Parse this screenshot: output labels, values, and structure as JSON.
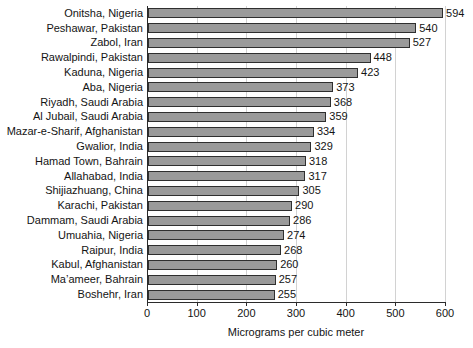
{
  "chart_data": {
    "type": "bar",
    "orientation": "horizontal",
    "title": "",
    "xlabel": "Micrograms per cubic meter",
    "ylabel": "",
    "xlim": [
      0,
      600
    ],
    "xticks": [
      0,
      100,
      200,
      300,
      400,
      500,
      600
    ],
    "grid": "vertical",
    "legend": "none",
    "bar_color": "#9a9a9a",
    "bar_edge_color": "#2f2f2f",
    "categories": [
      "Onitsha, Nigeria",
      "Peshawar, Pakistan",
      "Zabol, Iran",
      "Rawalpindi, Pakistan",
      "Kaduna, Nigeria",
      "Aba, Nigeria",
      "Riyadh, Saudi Arabia",
      "Al Jubail, Saudi Arabia",
      "Mazar-e-Sharif, Afghanistan",
      "Gwalior, India",
      "Hamad Town, Bahrain",
      "Allahabad, India",
      "Shijiazhuang, China",
      "Karachi, Pakistan",
      "Dammam, Saudi Arabia",
      "Umuahia, Nigeria",
      "Raipur, India",
      "Kabul, Afghanistan",
      "Ma’ameer, Bahrain",
      "Boshehr, Iran"
    ],
    "values": [
      594,
      540,
      527,
      448,
      423,
      373,
      368,
      359,
      334,
      329,
      318,
      317,
      305,
      290,
      286,
      274,
      268,
      260,
      257,
      255
    ]
  }
}
